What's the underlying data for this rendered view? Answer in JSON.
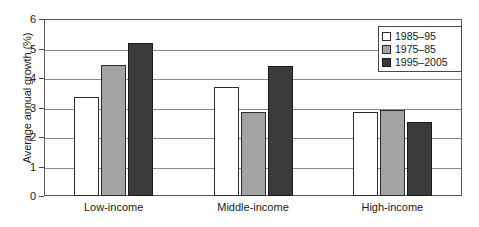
{
  "chart_data": {
    "type": "bar",
    "title": "",
    "subtitle": "",
    "xlabel": "",
    "ylabel": "Average annual growth (%)",
    "categories": [
      "Low-income",
      "Middle-income",
      "High-income"
    ],
    "series": [
      {
        "name": "1985–95",
        "color": "#ffffff",
        "values": [
          3.35,
          3.7,
          2.85
        ]
      },
      {
        "name": "1975–85",
        "color": "#a3a3a3",
        "values": [
          4.45,
          2.85,
          2.9
        ]
      },
      {
        "name": "1995–2005",
        "color": "#3b3b3b",
        "values": [
          5.2,
          4.4,
          2.5
        ]
      }
    ],
    "ylim": [
      0,
      6
    ],
    "yticks": [
      0,
      1,
      2,
      3,
      4,
      5,
      6
    ],
    "ytick_labels": [
      "0",
      "1",
      "2",
      "3",
      "4",
      "5",
      "6"
    ],
    "grid": true,
    "grid_axis": "y",
    "legend_position": "top-right",
    "annotations": []
  },
  "legend": {
    "entries": [
      {
        "label": "1985–95"
      },
      {
        "label": "1975–85"
      },
      {
        "label": "1995–2005"
      }
    ]
  }
}
